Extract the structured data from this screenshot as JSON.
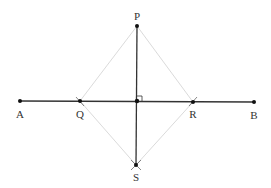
{
  "diagram": {
    "points": {
      "A": {
        "label": "A",
        "x": 20,
        "y": 101
      },
      "Q": {
        "label": "Q",
        "x": 80,
        "y": 101
      },
      "M": {
        "label": "",
        "x": 137,
        "y": 101
      },
      "R": {
        "label": "R",
        "x": 193,
        "y": 102
      },
      "B": {
        "label": "B",
        "x": 254,
        "y": 102
      },
      "P": {
        "label": "P",
        "x": 137,
        "y": 26
      },
      "S": {
        "label": "S",
        "x": 136,
        "y": 165
      }
    },
    "labels": {
      "A": "A",
      "Q": "Q",
      "R": "R",
      "B": "B",
      "P": "P",
      "S": "S"
    },
    "segments": [
      "AB",
      "PS"
    ],
    "construction_lines": [
      "PQ",
      "PR",
      "QS",
      "RS"
    ],
    "right_angle_marker": "at intersection of AB and PS",
    "colors": {
      "main_line": "#333333",
      "construction_line": "#cccccc",
      "point": "#111111"
    }
  }
}
